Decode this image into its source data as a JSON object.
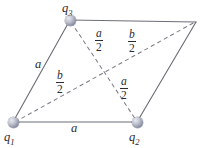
{
  "figure": {
    "background_color": "#ffffff",
    "line_color": "#6d6f78",
    "dash_color": "#7b7d86",
    "text_color": "#2b2b2f",
    "node_color": "#8f93a6"
  },
  "nodes": [
    {
      "id": "q1",
      "label": "q",
      "subscript": "1",
      "x": 13,
      "y": 122
    },
    {
      "id": "q2",
      "label": "q",
      "subscript": "2",
      "x": 137,
      "y": 122
    },
    {
      "id": "q3",
      "label": "q",
      "subscript": "3",
      "x": 70,
      "y": 20
    },
    {
      "id": "corner",
      "label": "",
      "subscript": "",
      "x": 195,
      "y": 22
    }
  ],
  "edges": [
    {
      "name": "left-side",
      "from": "q1",
      "to": "q3",
      "style": "solid"
    },
    {
      "name": "bottom-side",
      "from": "q1",
      "to": "q2",
      "style": "solid"
    },
    {
      "name": "top-side",
      "from": "q3",
      "to": "corner",
      "style": "solid"
    },
    {
      "name": "right-side",
      "from": "q2",
      "to": "corner",
      "style": "solid"
    },
    {
      "name": "diagonal-q1-corner",
      "from": "q1",
      "to": "corner",
      "style": "dashed"
    },
    {
      "name": "diagonal-q3-q2",
      "from": "q3",
      "to": "q2",
      "style": "dashed"
    }
  ],
  "labels": {
    "side_a_left": "a",
    "side_a_bottom": "a",
    "half_a_upper": {
      "numerator": "a",
      "denominator": "2"
    },
    "half_a_lower": {
      "numerator": "a",
      "denominator": "2"
    },
    "half_b_upper": {
      "numerator": "b",
      "denominator": "2"
    },
    "half_b_lower": {
      "numerator": "b",
      "denominator": "2"
    }
  }
}
